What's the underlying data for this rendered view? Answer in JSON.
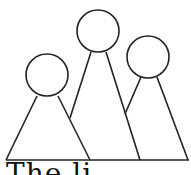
{
  "figure": {
    "stroke_color": "#222222",
    "background": "#ffffff"
  },
  "caption": {
    "text": "The   li"
  }
}
